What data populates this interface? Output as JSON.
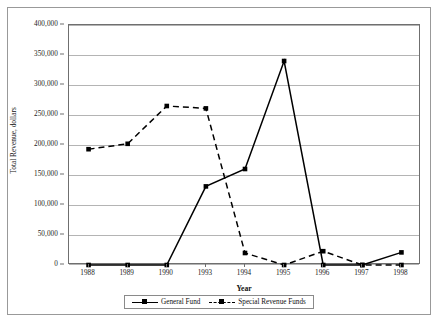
{
  "chart_data": {
    "type": "line",
    "title": "",
    "xlabel": "Year",
    "ylabel": "Total Revenue, dollars",
    "categories": [
      "1988",
      "1989",
      "1990",
      "1993",
      "1994",
      "1995",
      "1996",
      "1997",
      "1998"
    ],
    "ylim": [
      0,
      400000
    ],
    "ytick_values": [
      0,
      50000,
      100000,
      150000,
      200000,
      250000,
      300000,
      350000,
      400000
    ],
    "ytick_labels": [
      "0",
      "50,000",
      "100,000",
      "150,000",
      "200,000",
      "250,000",
      "300,000",
      "350,000",
      "400,000"
    ],
    "grid": true,
    "legend_position": "bottom",
    "series": [
      {
        "name": "General Fund",
        "line_style": "solid",
        "marker": "square",
        "color": "#000000",
        "values": [
          0,
          0,
          0,
          131000,
          160000,
          340000,
          0,
          0,
          21000
        ]
      },
      {
        "name": "Special Revenue Funds",
        "line_style": "dashed",
        "marker": "square",
        "color": "#000000",
        "values": [
          193000,
          202000,
          265000,
          261000,
          20000,
          0,
          23000,
          0,
          0
        ]
      }
    ]
  },
  "legend": {
    "items": [
      {
        "label": "General Fund"
      },
      {
        "label": "Special Revenue Funds"
      }
    ]
  },
  "axes": {
    "x_title": "Year",
    "y_title": "Total Revenue, dollars"
  }
}
